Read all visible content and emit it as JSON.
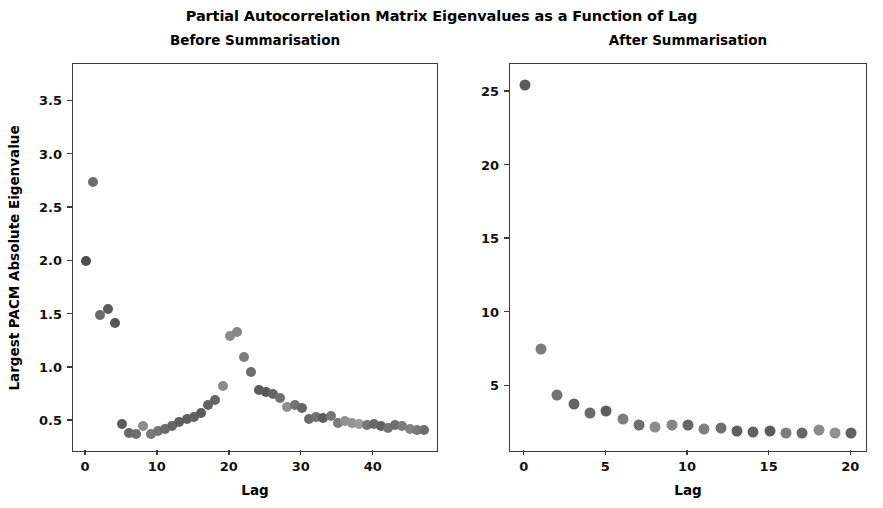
{
  "figure": {
    "suptitle": "Partial Autocorrelation Matrix Eigenvalues as a Function of Lag",
    "background": "#ffffff",
    "axes_color": "#3b3b3b"
  },
  "chart_data": [
    {
      "type": "scatter",
      "title": "Before Summarisation",
      "xlabel": "Lag",
      "ylabel": "Largest PACM Absolute Eigenvalue",
      "grid": false,
      "legend": null,
      "xlim": [
        -1.8,
        48.8
      ],
      "ylim": [
        0.22,
        3.85
      ],
      "xticks": [
        0,
        10,
        20,
        30,
        40
      ],
      "xticklabels": [
        "0",
        "10",
        "20",
        "30",
        "40"
      ],
      "yticks": [
        0.5,
        1.0,
        1.5,
        2.0,
        2.5,
        3.0,
        3.5
      ],
      "yticklabels": [
        "0.5",
        "1.0",
        "1.5",
        "2.0",
        "2.5",
        "3.0",
        "3.5"
      ],
      "x": [
        0,
        1,
        2,
        3,
        4,
        5,
        6,
        7,
        8,
        9,
        10,
        11,
        12,
        13,
        14,
        15,
        16,
        17,
        18,
        19,
        20,
        21,
        22,
        23,
        24,
        25,
        26,
        27,
        28,
        29,
        30,
        31,
        32,
        33,
        34,
        35,
        36,
        37,
        38,
        39,
        40,
        41,
        42,
        43,
        44,
        45,
        46,
        47
      ],
      "y": [
        2.0,
        2.74,
        1.5,
        1.55,
        1.42,
        0.47,
        0.39,
        0.38,
        0.45,
        0.38,
        0.41,
        0.43,
        0.45,
        0.49,
        0.52,
        0.54,
        0.58,
        0.65,
        0.7,
        0.83,
        1.3,
        1.34,
        1.1,
        0.96,
        0.79,
        0.77,
        0.75,
        0.72,
        0.63,
        0.65,
        0.62,
        0.52,
        0.54,
        0.53,
        0.55,
        0.48,
        0.5,
        0.48,
        0.47,
        0.46,
        0.47,
        0.45,
        0.44,
        0.46,
        0.45,
        0.43,
        0.42,
        0.42
      ],
      "marker_colors": [
        "#4e4e4e",
        "#6e6e6e",
        "#6a6a6a",
        "#595959",
        "#555555",
        "#5c5c5c",
        "#686868",
        "#6d6d6d",
        "#8d8d8d",
        "#7a7a7a",
        "#767676",
        "#6b6b6b",
        "#646464",
        "#5f5f5f",
        "#5e5e5e",
        "#606060",
        "#5b5b5b",
        "#626262",
        "#666666",
        "#8b8b8b",
        "#8a8a8a",
        "#868686",
        "#7c7c7c",
        "#6c6c6c",
        "#5a5a5a",
        "#585858",
        "#636363",
        "#6f6f6f",
        "#8e8e8e",
        "#727272",
        "#656565",
        "#6a6a6a",
        "#707070",
        "#5d5d5d",
        "#777777",
        "#787878",
        "#8f8f8f",
        "#929292",
        "#9a9a9a",
        "#747474",
        "#696969",
        "#616161",
        "#737373",
        "#6e6e6e",
        "#7b7b7b",
        "#828282",
        "#797979",
        "#6d6d6d"
      ],
      "marker_size_px": 10
    },
    {
      "type": "scatter",
      "title": "After Summarisation",
      "xlabel": "Lag",
      "ylabel": "",
      "grid": false,
      "legend": null,
      "xlim": [
        -0.9,
        20.9
      ],
      "ylim": [
        0.6,
        26.9
      ],
      "xticks": [
        0,
        5,
        10,
        15,
        20
      ],
      "xticklabels": [
        "0",
        "5",
        "10",
        "15",
        "20"
      ],
      "yticks": [
        5,
        10,
        15,
        20,
        25
      ],
      "yticklabels": [
        "5",
        "10",
        "15",
        "20",
        "25"
      ],
      "x": [
        0,
        1,
        2,
        3,
        4,
        5,
        6,
        7,
        8,
        9,
        10,
        11,
        12,
        13,
        14,
        15,
        16,
        17,
        18,
        19,
        20
      ],
      "y": [
        25.5,
        7.5,
        4.4,
        3.8,
        3.2,
        3.3,
        2.8,
        2.4,
        2.2,
        2.4,
        2.35,
        2.1,
        2.15,
        1.95,
        1.9,
        1.95,
        1.85,
        1.8,
        2.0,
        1.8,
        1.85
      ],
      "marker_colors": [
        "#5b5b5b",
        "#7b7b7b",
        "#747474",
        "#646464",
        "#6a6a6a",
        "#5e5e5e",
        "#7e7e7e",
        "#6e6e6e",
        "#8c8c8c",
        "#858585",
        "#666666",
        "#7f7f7f",
        "#6f6f6f",
        "#5f5f5f",
        "#626262",
        "#5c5c5c",
        "#7c7c7c",
        "#676767",
        "#8a8a8a",
        "#909090",
        "#616161"
      ],
      "marker_size_px": 11
    }
  ]
}
